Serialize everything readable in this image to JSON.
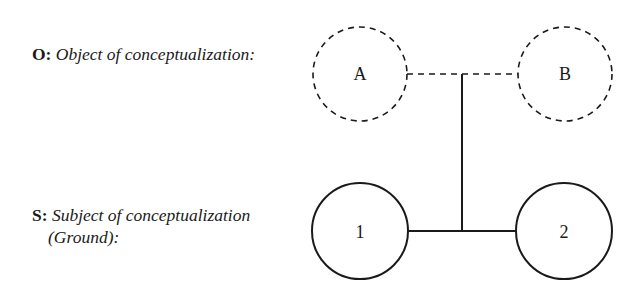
{
  "labels": {
    "object": {
      "prefix": "O:",
      "text": "Object of conceptualization:"
    },
    "subject": {
      "prefix": "S:",
      "text_line1": "Subject of conceptualization",
      "text_line2": "(Ground):"
    }
  },
  "nodes": {
    "object_nodes": [
      {
        "id": "A",
        "label": "A",
        "style": "dashed"
      },
      {
        "id": "B",
        "label": "B",
        "style": "dashed"
      }
    ],
    "subject_nodes": [
      {
        "id": "1",
        "label": "1",
        "style": "solid"
      },
      {
        "id": "2",
        "label": "2",
        "style": "solid"
      }
    ]
  },
  "connections": [
    {
      "from": "A",
      "to": "B",
      "style": "dashed"
    },
    {
      "from": "1",
      "to": "2",
      "style": "solid"
    },
    {
      "from": "A-B link",
      "to": "1-2 link",
      "style": "solid"
    }
  ],
  "colors": {
    "stroke": "#1a1a1a",
    "background": "#ffffff"
  }
}
